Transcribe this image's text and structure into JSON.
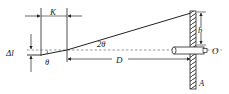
{
  "diagram": {
    "type": "optics-lever-measurement",
    "labels": {
      "K": "K",
      "delta_l": "Δl",
      "theta": "θ",
      "two_theta": "2θ",
      "D": "D",
      "b": "b",
      "O": "O",
      "A": "A"
    },
    "colors": {
      "line": "#222222",
      "dashed": "#555555",
      "background": "#ffffff"
    }
  }
}
